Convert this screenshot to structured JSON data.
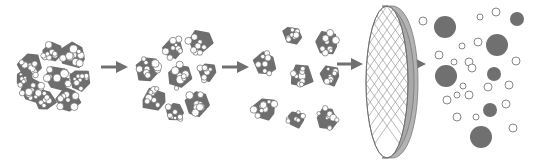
{
  "diagram": {
    "type": "process-flow",
    "colors": {
      "background": "#ffffff",
      "cluster_fill": "#6e6e6e",
      "particle_stroke": "#6a6a6a",
      "small_particle_fill": "#ffffff",
      "large_particle_fill": "#707070",
      "arrow": "#707070",
      "filter_rim": "#b0b0b0",
      "filter_mesh": "#8a8a8a"
    },
    "stages": [
      {
        "id": "agglomerate",
        "label": ""
      },
      {
        "id": "clusters-stage-1",
        "label": ""
      },
      {
        "id": "clusters-stage-2",
        "label": ""
      },
      {
        "id": "filter",
        "label": ""
      },
      {
        "id": "dispersed-particles",
        "label": ""
      }
    ],
    "arrows": [
      {
        "x1": 101,
        "y1": 67,
        "x2": 127,
        "y2": 67
      },
      {
        "x1": 222,
        "y1": 67,
        "x2": 248,
        "y2": 67
      },
      {
        "x1": 337,
        "y1": 64,
        "x2": 362,
        "y2": 64
      },
      {
        "x1": 380,
        "y1": 64,
        "x2": 425,
        "y2": 64
      }
    ],
    "clusters_stage1": [
      {
        "cx": 173,
        "cy": 48,
        "r": 10
      },
      {
        "cx": 200,
        "cy": 42,
        "r": 12
      },
      {
        "cx": 147,
        "cy": 69,
        "r": 12
      },
      {
        "cx": 180,
        "cy": 76,
        "r": 12
      },
      {
        "cx": 207,
        "cy": 72,
        "r": 9
      },
      {
        "cx": 154,
        "cy": 100,
        "r": 11
      },
      {
        "cx": 175,
        "cy": 112,
        "r": 9
      },
      {
        "cx": 197,
        "cy": 104,
        "r": 11
      }
    ],
    "clusters_stage2": [
      {
        "cx": 292,
        "cy": 35,
        "r": 9
      },
      {
        "cx": 327,
        "cy": 42,
        "r": 11
      },
      {
        "cx": 265,
        "cy": 64,
        "r": 11
      },
      {
        "cx": 302,
        "cy": 76,
        "r": 11
      },
      {
        "cx": 330,
        "cy": 76,
        "r": 9
      },
      {
        "cx": 265,
        "cy": 109,
        "r": 11
      },
      {
        "cx": 296,
        "cy": 119,
        "r": 8
      },
      {
        "cx": 327,
        "cy": 118,
        "r": 10
      }
    ],
    "large_particles": [
      {
        "cx": 445,
        "cy": 27,
        "r": 11
      },
      {
        "cx": 517,
        "cy": 19,
        "r": 7
      },
      {
        "cx": 497,
        "cy": 45,
        "r": 11
      },
      {
        "cx": 446,
        "cy": 76,
        "r": 11
      },
      {
        "cx": 494,
        "cy": 74,
        "r": 7
      },
      {
        "cx": 490,
        "cy": 110,
        "r": 7
      },
      {
        "cx": 481,
        "cy": 137,
        "r": 11
      }
    ],
    "small_particles": [
      {
        "cx": 423,
        "cy": 21,
        "r": 4
      },
      {
        "cx": 480,
        "cy": 17,
        "r": 3
      },
      {
        "cx": 496,
        "cy": 12,
        "r": 4
      },
      {
        "cx": 462,
        "cy": 46,
        "r": 3
      },
      {
        "cx": 478,
        "cy": 42,
        "r": 4
      },
      {
        "cx": 439,
        "cy": 55,
        "r": 4
      },
      {
        "cx": 454,
        "cy": 62,
        "r": 3
      },
      {
        "cx": 469,
        "cy": 62,
        "r": 4
      },
      {
        "cx": 472,
        "cy": 68,
        "r": 4
      },
      {
        "cx": 516,
        "cy": 61,
        "r": 4
      },
      {
        "cx": 463,
        "cy": 86,
        "r": 3
      },
      {
        "cx": 488,
        "cy": 87,
        "r": 4
      },
      {
        "cx": 509,
        "cy": 85,
        "r": 4
      },
      {
        "cx": 457,
        "cy": 95,
        "r": 3
      },
      {
        "cx": 469,
        "cy": 95,
        "r": 4
      },
      {
        "cx": 447,
        "cy": 100,
        "r": 4
      },
      {
        "cx": 506,
        "cy": 104,
        "r": 4
      },
      {
        "cx": 457,
        "cy": 117,
        "r": 4
      },
      {
        "cx": 476,
        "cy": 117,
        "r": 3
      },
      {
        "cx": 513,
        "cy": 128,
        "r": 4
      }
    ]
  }
}
